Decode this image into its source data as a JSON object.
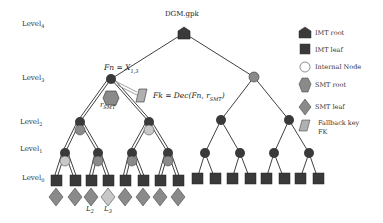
{
  "title": "DGM.gpk",
  "levels": [
    {
      "label": "Level",
      "sub": "4"
    },
    {
      "label": "Level",
      "sub": "3"
    },
    {
      "label": "Level",
      "sub": "2"
    },
    {
      "label": "Level",
      "sub": "1"
    },
    {
      "label": "Level",
      "sub": "0"
    }
  ],
  "annotations": {
    "fn": "Fn = X",
    "fn_sub": "1,3",
    "fk": "Fk = Dec(Fn, r",
    "fk_sub": "SMT",
    "fk_close": ")",
    "rsmt": "r",
    "rsmt_sub": "SMT",
    "l2": "L",
    "l2_sub": "2",
    "l3": "L",
    "l3_sub": "3"
  },
  "legend": [
    {
      "icon": "imt-root-pentagon",
      "label": "IMT root"
    },
    {
      "icon": "imt-leaf-square",
      "label": "IMT leaf"
    },
    {
      "icon": "internal-node-circle",
      "label": "Internal Node"
    },
    {
      "icon": "smt-root-hexagon",
      "label": "SMT root"
    },
    {
      "icon": "smt-leaf-diamond",
      "label": "SMT leaf"
    },
    {
      "icon": "fallback-key-parallelogram",
      "label": "Fallback key"
    },
    {
      "icon": "",
      "label": "FK"
    }
  ],
  "colors": {
    "dark": "#3a3a3a",
    "smt": "#8a8a8a",
    "light": "#c8c8c8",
    "edge": "#2a2a2a"
  }
}
